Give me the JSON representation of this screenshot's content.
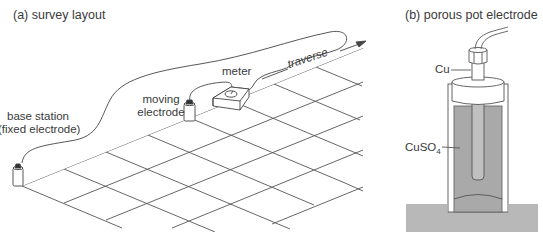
{
  "panel_a": {
    "title": "(a)  survey layout",
    "labels": {
      "base_station_line1": "base station",
      "base_station_line2": "(fixed electrode)",
      "moving_line1": "moving",
      "moving_line2": "electrode",
      "meter": "meter",
      "traverse": "traverse"
    }
  },
  "panel_b": {
    "title": "(b)  porous pot electrode",
    "labels": {
      "cu": "Cu",
      "cuso4_main": "CuSO",
      "cuso4_sub": "4"
    }
  },
  "colors": {
    "line": "#555555",
    "solution": "#a9a9a9",
    "ground": "#b8b8b8",
    "cap": "#ffffff"
  }
}
